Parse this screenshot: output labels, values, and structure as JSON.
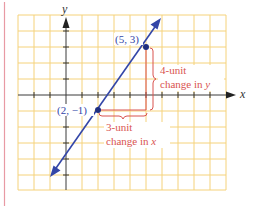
{
  "figure": {
    "axes": {
      "x_label": "x",
      "y_label": "y"
    },
    "points": [
      {
        "label": "(5, 3)",
        "x": 5,
        "y": 3
      },
      {
        "label": "(2, −1)",
        "x": 2,
        "y": -1
      }
    ],
    "annotations": {
      "rise_line1": "4-unit",
      "rise_line2_prefix": "change in ",
      "rise_line2_var": "y",
      "run_line1": "3-unit",
      "run_line2_prefix": "change in ",
      "run_line2_var": "x"
    },
    "colors": {
      "grid": "#f5d27a",
      "axis": "#3a3a3a",
      "line": "#3346a8",
      "annotation": "#d9534f",
      "margin": "#e89aa4",
      "label": "#3346a8"
    }
  }
}
